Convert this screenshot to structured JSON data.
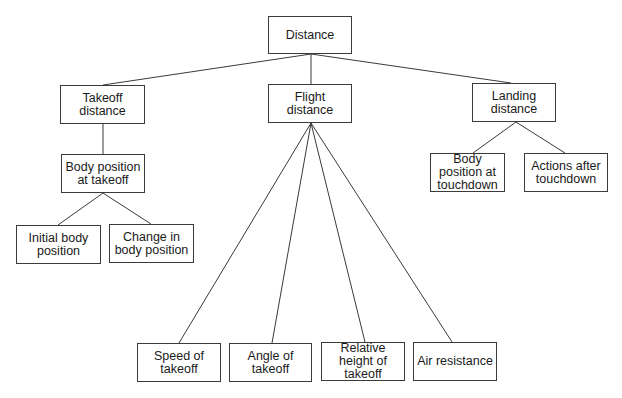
{
  "diagram": {
    "type": "tree",
    "root": "Distance",
    "nodes": [
      {
        "id": "distance",
        "label": "Distance",
        "x": 268,
        "y": 16,
        "w": 84,
        "h": 38
      },
      {
        "id": "takeoff",
        "label": "Takeoff distance",
        "x": 60,
        "y": 85,
        "w": 85,
        "h": 39
      },
      {
        "id": "flight",
        "label": "Flight distance",
        "x": 268,
        "y": 84,
        "w": 84,
        "h": 39
      },
      {
        "id": "landing",
        "label": "Landing distance",
        "x": 472,
        "y": 83,
        "w": 84,
        "h": 39
      },
      {
        "id": "body_takeoff",
        "label": "Body position at takeoff",
        "x": 61,
        "y": 154,
        "w": 84,
        "h": 39
      },
      {
        "id": "initial_body",
        "label": "Initial body position",
        "x": 16,
        "y": 225,
        "w": 85,
        "h": 39
      },
      {
        "id": "change_body",
        "label": "Change in body position",
        "x": 109,
        "y": 224,
        "w": 85,
        "h": 39
      },
      {
        "id": "body_touchdown",
        "label": "Body position at touchdown",
        "x": 430,
        "y": 153,
        "w": 75,
        "h": 39
      },
      {
        "id": "actions_after",
        "label": "Actions after touchdown",
        "x": 524,
        "y": 153,
        "w": 84,
        "h": 39
      },
      {
        "id": "speed",
        "label": "Speed of takeoff",
        "x": 137,
        "y": 343,
        "w": 84,
        "h": 39
      },
      {
        "id": "angle",
        "label": "Angle of takeoff",
        "x": 229,
        "y": 343,
        "w": 83,
        "h": 39
      },
      {
        "id": "rel_height",
        "label": "Relative height of takeoff",
        "x": 321,
        "y": 342,
        "w": 84,
        "h": 39
      },
      {
        "id": "air",
        "label": "Air resistance",
        "x": 413,
        "y": 342,
        "w": 84,
        "h": 39
      }
    ],
    "edges": [
      {
        "from": "distance",
        "to": "takeoff",
        "x1": 311,
        "y1": 54,
        "x2": 103,
        "y2": 85
      },
      {
        "from": "distance",
        "to": "flight",
        "x1": 311,
        "y1": 54,
        "x2": 311,
        "y2": 84
      },
      {
        "from": "distance",
        "to": "landing",
        "x1": 311,
        "y1": 54,
        "x2": 511,
        "y2": 83
      },
      {
        "from": "takeoff",
        "to": "body_takeoff",
        "x1": 103,
        "y1": 124,
        "x2": 103,
        "y2": 154
      },
      {
        "from": "body_takeoff",
        "to": "initial_body",
        "x1": 103,
        "y1": 193,
        "x2": 58,
        "y2": 225
      },
      {
        "from": "body_takeoff",
        "to": "change_body",
        "x1": 103,
        "y1": 193,
        "x2": 151,
        "y2": 224
      },
      {
        "from": "landing",
        "to": "body_touchdown",
        "x1": 516,
        "y1": 122,
        "x2": 473,
        "y2": 153
      },
      {
        "from": "landing",
        "to": "actions_after",
        "x1": 516,
        "y1": 122,
        "x2": 565,
        "y2": 153
      },
      {
        "from": "flight",
        "to": "speed",
        "x1": 311,
        "y1": 123,
        "x2": 179,
        "y2": 343
      },
      {
        "from": "flight",
        "to": "angle",
        "x1": 311,
        "y1": 123,
        "x2": 272,
        "y2": 343
      },
      {
        "from": "flight",
        "to": "rel_height",
        "x1": 311,
        "y1": 123,
        "x2": 365,
        "y2": 342
      },
      {
        "from": "flight",
        "to": "air",
        "x1": 311,
        "y1": 123,
        "x2": 452,
        "y2": 342
      }
    ]
  },
  "colors": {
    "line": "#3a3a3a",
    "border": "#3a3a3a",
    "text": "#1a1a1a",
    "background": "#ffffff"
  }
}
